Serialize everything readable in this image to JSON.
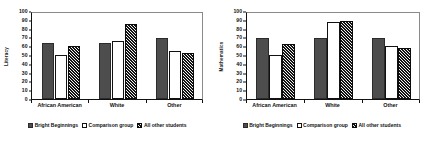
{
  "figure": {
    "background": "#ffffff",
    "series_colors": {
      "bright_beginnings": "#4d4d4d",
      "comparison_group": "#ffffff",
      "all_other_students": "#141414"
    }
  },
  "legend": {
    "position": "bottom-center",
    "entries": [
      {
        "label": "Bright Beginnings",
        "swatch": "solid-gray-swatch"
      },
      {
        "label": "Comparison group",
        "swatch": "white-outline-swatch"
      },
      {
        "label": "All other students",
        "swatch": "hatched-black-swatch"
      }
    ]
  },
  "charts": [
    {
      "id": "literacy",
      "ylabel": "Literacy",
      "ticks": [
        "0",
        "10",
        "20",
        "30",
        "40",
        "50",
        "60",
        "70",
        "80",
        "90",
        "100"
      ]
    },
    {
      "id": "mathematics",
      "ylabel": "Mathematics",
      "ticks": [
        "0",
        "10",
        "20",
        "30",
        "40",
        "50",
        "60",
        "70",
        "80",
        "90",
        "100"
      ]
    }
  ],
  "chart_data": [
    {
      "type": "bar",
      "title": "",
      "xlabel": "",
      "ylabel": "Literacy",
      "ylim": [
        0,
        100
      ],
      "ytick_step": 10,
      "grid": false,
      "legend_position": "bottom-center",
      "categories": [
        "African American",
        "White",
        "Other"
      ],
      "series": [
        {
          "name": "Bright Beginnings",
          "values": [
            64,
            64,
            69
          ]
        },
        {
          "name": "Comparison group",
          "values": [
            50,
            66,
            55
          ]
        },
        {
          "name": "All other students",
          "values": [
            60,
            85,
            52
          ]
        }
      ]
    },
    {
      "type": "bar",
      "title": "",
      "xlabel": "",
      "ylabel": "Mathematics",
      "ylim": [
        0,
        100
      ],
      "ytick_step": 10,
      "grid": false,
      "legend_position": "bottom-center",
      "categories": [
        "African American",
        "White",
        "Other"
      ],
      "series": [
        {
          "name": "Bright Beginnings",
          "values": [
            69,
            69,
            69
          ]
        },
        {
          "name": "Comparison group",
          "values": [
            50,
            87,
            60
          ]
        },
        {
          "name": "All other students",
          "values": [
            62,
            89,
            58
          ]
        }
      ]
    }
  ]
}
